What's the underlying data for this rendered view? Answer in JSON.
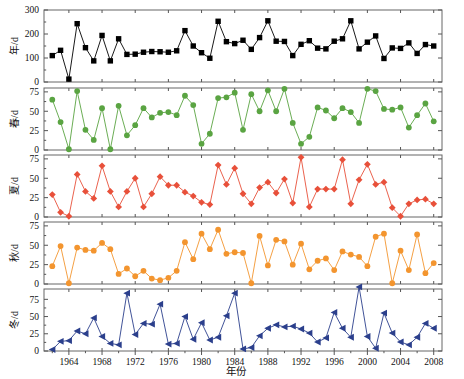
{
  "figure": {
    "x_axis_title": "年份",
    "x_tick_labels": [
      "1964",
      "1968",
      "1972",
      "1976",
      "1980",
      "1984",
      "1988",
      "1992",
      "1996",
      "2000",
      "2004",
      "2008"
    ],
    "x_range": [
      1961,
      2009
    ],
    "background": "#ffffff",
    "frame_color": "#666666"
  },
  "chart_data": [
    {
      "type": "line",
      "title": "",
      "panel": "annual",
      "ylabel": "年/d",
      "xlabel": "年份",
      "ylim": [
        0,
        300
      ],
      "yticks": [
        0,
        100,
        200,
        300
      ],
      "grid": false,
      "legend": "none",
      "color": "#000000",
      "marker": "square",
      "x": [
        1962,
        1963,
        1964,
        1965,
        1966,
        1967,
        1968,
        1969,
        1970,
        1971,
        1972,
        1973,
        1974,
        1975,
        1976,
        1977,
        1978,
        1979,
        1980,
        1981,
        1982,
        1983,
        1984,
        1985,
        1986,
        1987,
        1988,
        1989,
        1990,
        1991,
        1992,
        1993,
        1994,
        1995,
        1996,
        1997,
        1998,
        1999,
        2000,
        2001,
        2002,
        2003,
        2004,
        2005,
        2006,
        2007,
        2008
      ],
      "values": [
        110,
        132,
        12,
        243,
        143,
        88,
        194,
        88,
        180,
        115,
        116,
        124,
        127,
        126,
        124,
        130,
        214,
        150,
        122,
        99,
        253,
        168,
        160,
        174,
        136,
        185,
        255,
        170,
        169,
        110,
        157,
        172,
        141,
        138,
        170,
        180,
        255,
        138,
        166,
        192,
        98,
        142,
        140,
        163,
        119,
        156,
        150
      ]
    },
    {
      "type": "line",
      "panel": "spring",
      "ylabel": "春/d",
      "xlabel": "",
      "ylim": [
        0,
        80
      ],
      "yticks": [
        0,
        25,
        50,
        75
      ],
      "grid": false,
      "legend": "none",
      "color": "#5aa442",
      "marker": "circle",
      "x": [
        1962,
        1963,
        1964,
        1965,
        1966,
        1967,
        1968,
        1969,
        1970,
        1971,
        1972,
        1973,
        1974,
        1975,
        1976,
        1977,
        1978,
        1979,
        1980,
        1981,
        1982,
        1983,
        1984,
        1985,
        1986,
        1987,
        1988,
        1989,
        1990,
        1991,
        1992,
        1993,
        1994,
        1995,
        1996,
        1997,
        1998,
        1999,
        2000,
        2001,
        2002,
        2003,
        2004,
        2005,
        2006,
        2007,
        2008
      ],
      "values": [
        65,
        36,
        1,
        76,
        26,
        13,
        54,
        1,
        57,
        19,
        32,
        54,
        42,
        48,
        49,
        45,
        70,
        58,
        8,
        21,
        67,
        68,
        74,
        26,
        72,
        50,
        77,
        50,
        79,
        35,
        8,
        17,
        55,
        51,
        41,
        54,
        49,
        35,
        79,
        76,
        53,
        52,
        55,
        29,
        45,
        60,
        37
      ]
    },
    {
      "type": "line",
      "panel": "summer",
      "ylabel": "夏/d",
      "xlabel": "",
      "ylim": [
        0,
        80
      ],
      "yticks": [
        0,
        25,
        50,
        75
      ],
      "grid": false,
      "legend": "none",
      "color": "#e8503a",
      "marker": "diamond",
      "x": [
        1962,
        1963,
        1964,
        1965,
        1966,
        1967,
        1968,
        1969,
        1970,
        1971,
        1972,
        1973,
        1974,
        1975,
        1976,
        1977,
        1978,
        1979,
        1980,
        1981,
        1982,
        1983,
        1984,
        1985,
        1986,
        1987,
        1988,
        1989,
        1990,
        1991,
        1992,
        1993,
        1994,
        1995,
        1996,
        1997,
        1998,
        1999,
        2000,
        2001,
        2002,
        2003,
        2004,
        2005,
        2006,
        2007,
        2008
      ],
      "values": [
        29,
        6,
        1,
        55,
        33,
        24,
        66,
        33,
        13,
        33,
        50,
        13,
        30,
        52,
        41,
        41,
        32,
        27,
        19,
        16,
        67,
        42,
        63,
        30,
        17,
        38,
        45,
        31,
        49,
        18,
        77,
        13,
        36,
        36,
        36,
        74,
        17,
        48,
        68,
        42,
        45,
        12,
        1,
        17,
        22,
        23,
        17
      ]
    },
    {
      "type": "line",
      "panel": "autumn",
      "ylabel": "秋/d",
      "xlabel": "",
      "ylim": [
        0,
        80
      ],
      "yticks": [
        0,
        25,
        50,
        75
      ],
      "grid": false,
      "legend": "none",
      "color": "#f3952f",
      "marker": "circle",
      "x": [
        1962,
        1963,
        1964,
        1965,
        1966,
        1967,
        1968,
        1969,
        1970,
        1971,
        1972,
        1973,
        1974,
        1975,
        1976,
        1977,
        1978,
        1979,
        1980,
        1981,
        1982,
        1983,
        1984,
        1985,
        1986,
        1987,
        1988,
        1989,
        1990,
        1991,
        1992,
        1993,
        1994,
        1995,
        1996,
        1997,
        1998,
        1999,
        2000,
        2001,
        2002,
        2003,
        2004,
        2005,
        2006,
        2007,
        2008
      ],
      "values": [
        23,
        49,
        1,
        47,
        44,
        43,
        53,
        45,
        13,
        20,
        10,
        17,
        7,
        5,
        8,
        17,
        54,
        32,
        65,
        45,
        70,
        39,
        41,
        40,
        1,
        62,
        24,
        57,
        55,
        25,
        52,
        19,
        30,
        33,
        18,
        42,
        38,
        35,
        23,
        61,
        65,
        1,
        43,
        18,
        64,
        14,
        27
      ]
    },
    {
      "type": "line",
      "panel": "winter",
      "ylabel": "冬/d",
      "xlabel": "",
      "ylim": [
        0,
        90
      ],
      "yticks": [
        0,
        25,
        50,
        75
      ],
      "grid": false,
      "legend": "none",
      "color": "#2b3f8c",
      "marker": "triangle-left",
      "x": [
        1962,
        1963,
        1964,
        1965,
        1966,
        1967,
        1968,
        1969,
        1970,
        1971,
        1972,
        1973,
        1974,
        1975,
        1976,
        1977,
        1978,
        1979,
        1980,
        1981,
        1982,
        1983,
        1984,
        1985,
        1986,
        1987,
        1988,
        1989,
        1990,
        1991,
        1992,
        1993,
        1994,
        1995,
        1996,
        1997,
        1998,
        1999,
        2000,
        2001,
        2002,
        2003,
        2004,
        2005,
        2006,
        2007,
        2008
      ],
      "values": [
        2,
        14,
        15,
        29,
        25,
        48,
        21,
        11,
        9,
        84,
        24,
        40,
        39,
        68,
        10,
        11,
        50,
        17,
        41,
        16,
        20,
        51,
        84,
        3,
        5,
        22,
        33,
        38,
        35,
        36,
        32,
        26,
        13,
        19,
        56,
        33,
        20,
        93,
        21,
        4,
        55,
        26,
        13,
        9,
        20,
        40,
        33
      ]
    }
  ],
  "y_axis_labels": {
    "annual": "年/d",
    "spring": "春/d",
    "summer": "夏/d",
    "autumn": "秋/d",
    "winter": "冬/d"
  },
  "colors": {
    "annual": "#000000",
    "spring": "#5aa442",
    "summer": "#e8503a",
    "autumn": "#f3952f",
    "winter": "#2b3f8c"
  }
}
